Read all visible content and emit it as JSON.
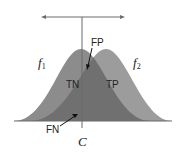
{
  "diagram": {
    "curves": [
      {
        "name": "f",
        "subscript": "1",
        "color": "#8a8a8a"
      },
      {
        "name": "f",
        "subscript": "2",
        "color": "#9a9a9a"
      }
    ],
    "regions": {
      "tn": "TN",
      "tp": "TP",
      "fp": "FP",
      "fn": "FN"
    },
    "threshold_label": "C",
    "colors": {
      "overlap": "#6f6f6f",
      "line": "#6a6a6a",
      "text": "#222222"
    }
  }
}
